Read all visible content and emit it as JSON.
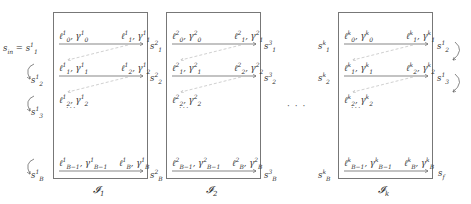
{
  "diagram": {
    "title": "",
    "start_label": "s_in = s^1_1",
    "end_label": "s_f",
    "ellipsis_between_blocks": "· · ·",
    "blocks": [
      {
        "name": "I_1",
        "caption": "𝓘₁",
        "k": "1",
        "left_states": [
          "s^1_1",
          "s^1_2",
          "s^1_3",
          "s^1_B"
        ],
        "right_states": [
          "s^2_1",
          "s^2_2",
          "s^2_B"
        ],
        "rows": [
          {
            "left": "ℓ¹₀, γ¹₀",
            "right": "ℓ¹₁, γ¹₁"
          },
          {
            "left": "ℓ¹₁, γ¹₁",
            "right": "ℓ¹₂, γ¹₂"
          },
          {
            "left": "ℓ¹₂, γ¹₂",
            "right": ""
          },
          {
            "left": "ℓ¹_{B−1}, γ¹_{B−1}",
            "right": "ℓ¹_B, γ¹_B"
          }
        ]
      },
      {
        "name": "I_2",
        "caption": "𝓘₂",
        "k": "2",
        "left_states": [
          "s^2_1",
          "s^2_2",
          "s^2_B"
        ],
        "right_states": [
          "s^3_1",
          "s^3_2",
          "s^3_B"
        ],
        "rows": [
          {
            "left": "ℓ²₀, γ²₀",
            "right": "ℓ²₁, γ²₁"
          },
          {
            "left": "ℓ²₁, γ²₁",
            "right": "ℓ²₂, γ²₂"
          },
          {
            "left": "ℓ²₂, γ²₂",
            "right": ""
          },
          {
            "left": "ℓ²_{B−1}, γ²_{B−1}",
            "right": "ℓ²_B, γ²_B"
          }
        ]
      },
      {
        "name": "I_k",
        "caption": "𝓘ₖ",
        "k": "k",
        "left_states": [
          "s^k_1",
          "s^k_2",
          "s^k_B"
        ],
        "right_states": [
          "s^1_2",
          "s^1_3",
          "s_f"
        ],
        "rows": [
          {
            "left": "ℓᵏ₀, γᵏ₀",
            "right": "ℓᵏ₁, γᵏ₁"
          },
          {
            "left": "ℓᵏ₁, γᵏ₁",
            "right": "ℓᵏ₂, γᵏ₂"
          },
          {
            "left": "ℓᵏ₂, γᵏ₂",
            "right": ""
          },
          {
            "left": "ℓᵏ_{B−1}, γᵏ_{B−1}",
            "right": "ℓᵏ_B, γᵏ_B"
          }
        ]
      }
    ],
    "inner_ellipsis": "···",
    "colors": {
      "arrow": "#555555",
      "dashed": "#bbbbbb",
      "box": "#777777"
    }
  }
}
